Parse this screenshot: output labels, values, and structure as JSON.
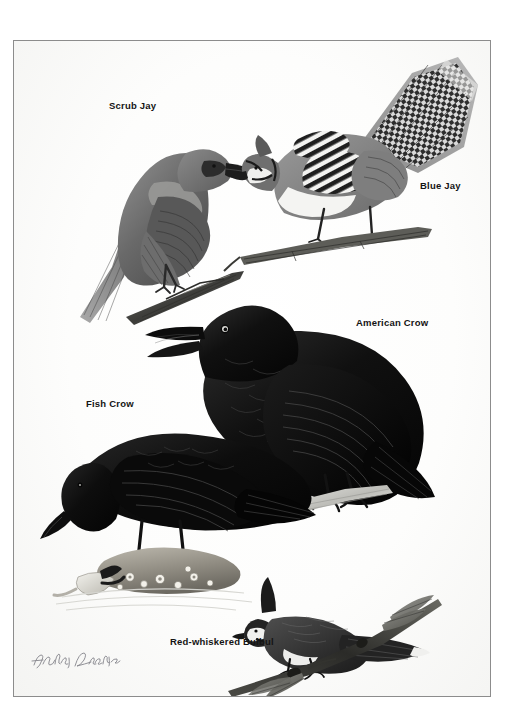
{
  "plate": {
    "type": "field-guide-illustration-plate",
    "medium": "black-and-white scratchboard / gouache rendering",
    "background_color": "#fbfbfa",
    "border_color": "#8c8c8c",
    "ink_color": "#141414",
    "artist_signature": "Karl E. Karalus",
    "signature_style": "handwritten cursive, pencil-gray"
  },
  "labels": [
    {
      "id": "scrub-jay",
      "text": "Scrub Jay",
      "x": 108,
      "y": 60
    },
    {
      "id": "blue-jay",
      "text": "Blue Jay",
      "x": 406,
      "y": 140
    },
    {
      "id": "american-crow",
      "text": "American Crow",
      "x": 342,
      "y": 278
    },
    {
      "id": "fish-crow",
      "text": "Fish Crow",
      "x": 72,
      "y": 358
    },
    {
      "id": "red-whiskered-bulbul",
      "text": "Red-whiskered Bulbul",
      "x": 156,
      "y": 596
    }
  ],
  "figures": [
    {
      "id": "scrub-jay",
      "common_name": "Scrub Jay",
      "tone": "mid-gray",
      "pose": "perched on a bare twig, facing right, long tail angled down-left",
      "notes": "pale underparts, dark mask through eye, mottled gray mantle"
    },
    {
      "id": "blue-jay",
      "common_name": "Blue Jay",
      "tone": "gray with bold black-and-white barring",
      "pose": "crouched forward on a twig, crest raised, wings and tail strongly barred",
      "notes": "checkered wing coverts and tail, black necklace"
    },
    {
      "id": "american-crow",
      "common_name": "American Crow",
      "tone": "solid black",
      "pose": "perched on a pale branch, head raised, bill open calling",
      "notes": "heavy bill, scaled breast feathering, glossy highlights"
    },
    {
      "id": "fish-crow",
      "common_name": "Fish Crow",
      "tone": "solid black",
      "pose": "standing on a barnacle-encrusted rock, head lowered toward the water",
      "notes": "slimmer bill than American Crow; crab claw and ripples in foreground"
    },
    {
      "id": "red-whiskered-bulbul",
      "common_name": "Red-whiskered Bulbul",
      "tone": "dark gray and white",
      "pose": "perched on a leafy twig, tall pointed crest, body facing right",
      "notes": "white cheek patch, dark malar stripe, white-tipped tail"
    }
  ]
}
